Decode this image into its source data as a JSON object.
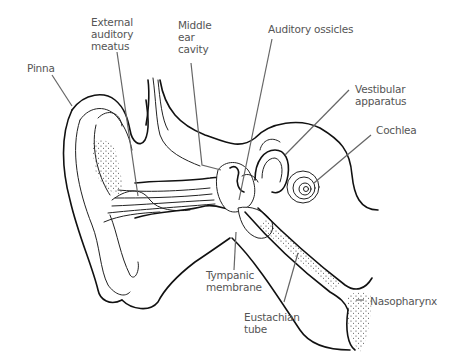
{
  "diagram": {
    "line_color": "#111111",
    "label_color": "#555555",
    "labels": [
      {
        "id": "pinna",
        "text": "Pinna"
      },
      {
        "id": "external-auditory-meatus",
        "text": "External\nauditory\nmeatus"
      },
      {
        "id": "middle-ear-cavity",
        "text": "Middle\near\ncavity"
      },
      {
        "id": "auditory-ossicles",
        "text": "Auditory ossicles"
      },
      {
        "id": "vestibular-apparatus",
        "text": "Vestibular\napparatus"
      },
      {
        "id": "cochlea",
        "text": "Cochlea"
      },
      {
        "id": "tympanic-membrane",
        "text": "Tympanic\nmembrane"
      },
      {
        "id": "eustachian-tube",
        "text": "Eustachian\ntube"
      },
      {
        "id": "nasopharynx",
        "text": "Nasopharynx"
      }
    ]
  }
}
